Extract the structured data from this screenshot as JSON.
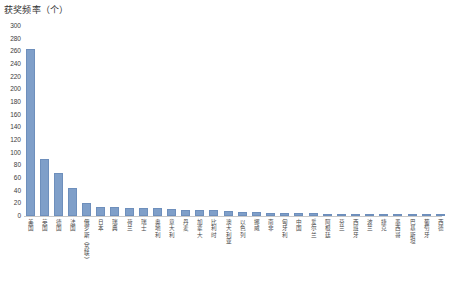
{
  "chart_data": {
    "type": "bar",
    "title": "获奖频率（个）",
    "xlabel": "",
    "ylabel": "获奖频率（个）",
    "ylim": [
      0,
      300
    ],
    "ytick_step": 20,
    "grid": false,
    "legend": "none",
    "bar_color": "#7f9fc9",
    "bar_edge_color": "#6e8fbc",
    "yticks": [
      "300",
      "280",
      "260",
      "240",
      "220",
      "200",
      "180",
      "160",
      "140",
      "120",
      "100",
      "80",
      "60",
      "40",
      "20",
      "0"
    ],
    "categories": [
      "美国",
      "英国",
      "德国",
      "法国",
      "俄罗斯（苏联）",
      "日本",
      "瑞典",
      "荷兰",
      "瑞士",
      "奥地利",
      "意大利",
      "丹麦",
      "加拿大",
      "比利时",
      "澳大利亚",
      "以色列",
      "挪威",
      "南非",
      "匈牙利",
      "中国",
      "爱尔兰",
      "阿根廷",
      "芬兰",
      "西班牙",
      "波兰",
      "捷克",
      "墨西哥",
      "巴基斯坦",
      "葡萄牙",
      "西德"
    ],
    "values": [
      263,
      90,
      68,
      45,
      20,
      15,
      14,
      13,
      13,
      12,
      11,
      10,
      9,
      9,
      8,
      7,
      6,
      5,
      5,
      4,
      4,
      3,
      3,
      3,
      2,
      2,
      2,
      1,
      1,
      1
    ]
  }
}
